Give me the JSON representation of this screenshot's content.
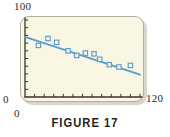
{
  "figure": {
    "caption": "FIGURE 17"
  },
  "chart_data": {
    "type": "scatter",
    "title": "",
    "subtitle": "",
    "xlabel": "",
    "ylabel": "",
    "xlim": [
      0,
      120
    ],
    "ylim": [
      0,
      100
    ],
    "x_tick_labels": [
      "0",
      "120"
    ],
    "y_tick_labels": [
      "0",
      "100"
    ],
    "x_tick_count": 12,
    "y_tick_count": 10,
    "x_tick_step": 10,
    "y_tick_step": 10,
    "grid": false,
    "legend": null,
    "legend_position": "none",
    "marker": "open-square",
    "marker_color": "#5b9bd0",
    "line_color": "#5b9bd0",
    "panel_background": "#faf6e4",
    "panel_border": "#b3ada0",
    "axis_color": "#3a352e",
    "series": [
      {
        "name": "observations",
        "points": [
          [
            14,
            67
          ],
          [
            24,
            76
          ],
          [
            33,
            71
          ],
          [
            45,
            60
          ],
          [
            54,
            54
          ],
          [
            63,
            57
          ],
          [
            72,
            56
          ],
          [
            78,
            49
          ],
          [
            88,
            42
          ],
          [
            98,
            39
          ],
          [
            110,
            41
          ]
        ]
      },
      {
        "name": "regression-line",
        "type": "line",
        "endpoints": [
          [
            0,
            78
          ],
          [
            120,
            29
          ]
        ],
        "slope": -0.408,
        "intercept": 78
      }
    ]
  }
}
